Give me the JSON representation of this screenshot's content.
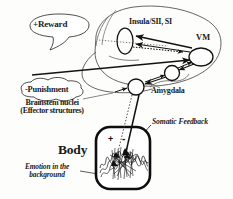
{
  "figure": {
    "background_color": "#fdfdfc",
    "ink_color": "#1a1a1a"
  },
  "callouts": {
    "reward": {
      "sign": "+",
      "text": "Reward",
      "full": "+Reward"
    },
    "punishment": {
      "sign": "-",
      "text": "Punishment",
      "full": "-Punishment"
    }
  },
  "brain_labels": {
    "insula": "Insula/SII, SI",
    "vm": "VM",
    "amygdala": "Amygdala",
    "brainstem_line1": "Brainstem nuclei",
    "brainstem_line2": "(Effector structures)"
  },
  "body_section": {
    "title": "Body",
    "somatic_feedback": "Somatic Feedback",
    "emotion_line1": "Emotion in the",
    "emotion_line2": "background",
    "plus_sign": "+",
    "minus_sign": "-"
  }
}
